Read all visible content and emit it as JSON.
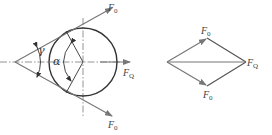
{
  "figure": {
    "left": {
      "force_top": {
        "main": "F",
        "sub": "0"
      },
      "force_bottom": {
        "main": "F",
        "sub": "0"
      },
      "force_axial": {
        "main": "F",
        "sub": "Q"
      },
      "angle_wedge": "γ",
      "angle_center": "α"
    },
    "right": {
      "force_top": {
        "main": "F",
        "sub": "0"
      },
      "force_bottom": {
        "main": "F",
        "sub": "0"
      },
      "force_resultant": {
        "main": "F",
        "sub": "Q"
      }
    },
    "colors": {
      "outline": "#333333",
      "force_lines": "#777777",
      "centerline": "#888888"
    }
  }
}
